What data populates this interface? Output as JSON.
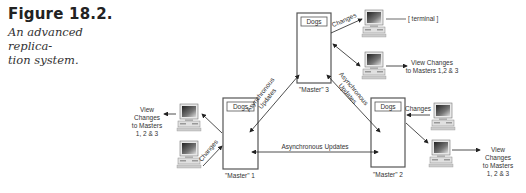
{
  "caption": {
    "figure_number": "Figure 18.2.",
    "subtitle_line1": "An advanced replica-",
    "subtitle_line2": "tion system."
  },
  "masters": [
    {
      "id": "master1",
      "label": "\"Master\" 1",
      "db_label": "Dogs"
    },
    {
      "id": "master2",
      "label": "\"Master\" 2",
      "db_label": "Dogs"
    },
    {
      "id": "master3",
      "label": "\"Master\" 3",
      "db_label": "Dogs"
    }
  ],
  "links": {
    "async_updates": "Asynchronous Updates",
    "async_line1": "Asynchronous",
    "async_line2": "Updates",
    "changes": "Changes"
  },
  "clients": {
    "terminal": "[ terminal ]",
    "view_right_top_line1": "View Changes",
    "view_right_top_line2": "to Masters 1,2 & 3",
    "view_left": [
      "View",
      "Changes",
      "to Masters",
      "1, 2 & 3"
    ],
    "view_right_bottom": [
      "View",
      "Changes",
      "to Masters",
      "1, 2 & 3"
    ]
  }
}
